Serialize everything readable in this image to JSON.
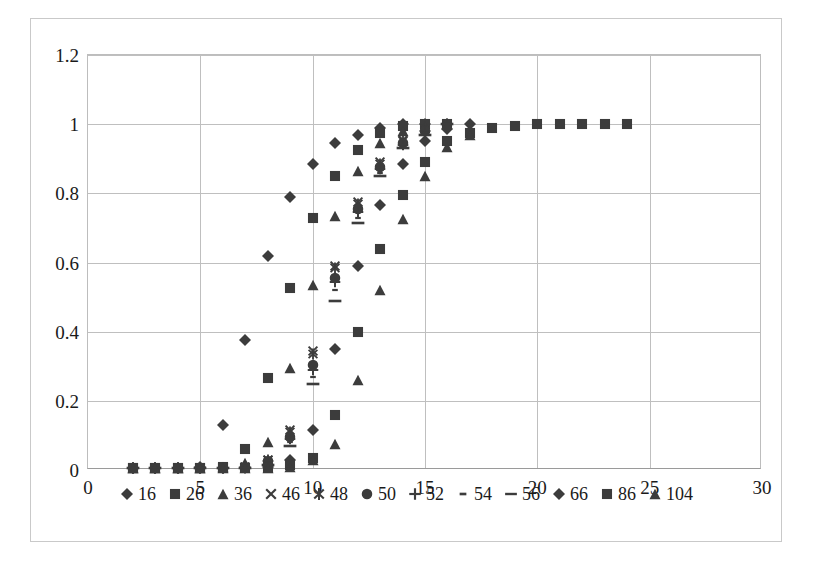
{
  "chart": {
    "type": "scatter",
    "marker_color": "#3c3c3c",
    "gridline_color": "#bfbfbf",
    "border_color": "#c9c9c9"
  },
  "axes": {
    "x": {
      "label": "",
      "min": 0,
      "max": 30,
      "ticks": [
        "0",
        "5",
        "10",
        "15",
        "20",
        "25",
        "30"
      ],
      "tick_values": [
        0,
        5,
        10,
        15,
        20,
        25,
        30
      ]
    },
    "y": {
      "label": "",
      "min": 0,
      "max": 1.2,
      "ticks": [
        "0",
        "0.2",
        "0.4",
        "0.6",
        "0.8",
        "1",
        "1.2"
      ],
      "tick_values": [
        0,
        0.2,
        0.4,
        0.6,
        0.8,
        1,
        1.2
      ]
    }
  },
  "legend": {
    "position": "bottom",
    "items": [
      {
        "label": "16",
        "marker": "diamond"
      },
      {
        "label": "26",
        "marker": "square"
      },
      {
        "label": "36",
        "marker": "triangle"
      },
      {
        "label": "46",
        "marker": "x-cross"
      },
      {
        "label": "48",
        "marker": "star"
      },
      {
        "label": "50",
        "marker": "circle"
      },
      {
        "label": "52",
        "marker": "plus"
      },
      {
        "label": "54",
        "marker": "short-dash"
      },
      {
        "label": "56",
        "marker": "long-dash"
      },
      {
        "label": "66",
        "marker": "diamond"
      },
      {
        "label": "86",
        "marker": "square"
      },
      {
        "label": "104",
        "marker": "triangle"
      }
    ]
  },
  "chart_data": {
    "type": "scatter",
    "title": "",
    "xlabel": "",
    "ylabel": "",
    "xlim": [
      0,
      30
    ],
    "ylim": [
      0,
      1.2
    ],
    "grid": true,
    "legend_position": "bottom",
    "marker_color": "#3c3c3c",
    "series": [
      {
        "name": "16",
        "marker": "diamond",
        "x": [
          2,
          3,
          4,
          5,
          6,
          7,
          8,
          9,
          10,
          11,
          12,
          13,
          14,
          15
        ],
        "y": [
          0.005,
          0.005,
          0.005,
          0.01,
          0.13,
          0.375,
          0.62,
          0.79,
          0.885,
          0.945,
          0.97,
          0.99,
          1.0,
          1.0
        ]
      },
      {
        "name": "26",
        "marker": "square",
        "x": [
          2,
          3,
          4,
          5,
          6,
          7,
          8,
          9,
          10,
          11,
          12,
          13,
          14,
          15,
          16
        ],
        "y": [
          0.005,
          0.005,
          0.005,
          0.005,
          0.01,
          0.06,
          0.265,
          0.525,
          0.73,
          0.85,
          0.925,
          0.975,
          0.995,
          1.0,
          1.0
        ]
      },
      {
        "name": "36",
        "marker": "triangle",
        "x": [
          2,
          3,
          4,
          5,
          6,
          7,
          8,
          9,
          10,
          11,
          12,
          13,
          14,
          15,
          16
        ],
        "y": [
          0.005,
          0.005,
          0.005,
          0.005,
          0.01,
          0.02,
          0.08,
          0.295,
          0.535,
          0.735,
          0.865,
          0.945,
          0.98,
          0.995,
          1.0
        ]
      },
      {
        "name": "46",
        "marker": "x-cross",
        "x": [
          2,
          3,
          4,
          5,
          6,
          7,
          8,
          9,
          10,
          11,
          12,
          13,
          14,
          15,
          16
        ],
        "y": [
          0.005,
          0.005,
          0.005,
          0.005,
          0.005,
          0.01,
          0.03,
          0.115,
          0.345,
          0.59,
          0.775,
          0.89,
          0.955,
          0.985,
          1.0
        ]
      },
      {
        "name": "48",
        "marker": "star",
        "x": [
          2,
          3,
          4,
          5,
          6,
          7,
          8,
          9,
          10,
          11,
          12,
          13,
          14,
          15,
          16
        ],
        "y": [
          0.005,
          0.005,
          0.005,
          0.005,
          0.005,
          0.01,
          0.03,
          0.11,
          0.335,
          0.585,
          0.77,
          0.885,
          0.95,
          0.985,
          1.0
        ]
      },
      {
        "name": "50",
        "marker": "circle",
        "x": [
          2,
          3,
          4,
          5,
          6,
          7,
          8,
          9,
          10,
          11,
          12,
          13,
          14,
          15,
          16
        ],
        "y": [
          0.005,
          0.005,
          0.005,
          0.005,
          0.005,
          0.01,
          0.025,
          0.095,
          0.305,
          0.555,
          0.755,
          0.875,
          0.945,
          0.98,
          1.0
        ]
      },
      {
        "name": "52",
        "marker": "plus",
        "x": [
          2,
          3,
          4,
          5,
          6,
          7,
          8,
          9,
          10,
          11,
          12,
          13,
          14,
          15,
          16
        ],
        "y": [
          0.005,
          0.005,
          0.005,
          0.005,
          0.005,
          0.01,
          0.025,
          0.09,
          0.29,
          0.545,
          0.745,
          0.87,
          0.94,
          0.98,
          1.0
        ]
      },
      {
        "name": "54",
        "marker": "short-dash",
        "x": [
          2,
          3,
          4,
          5,
          6,
          7,
          8,
          9,
          10,
          11,
          12,
          13,
          14,
          15,
          16
        ],
        "y": [
          0.005,
          0.005,
          0.005,
          0.005,
          0.005,
          0.005,
          0.02,
          0.08,
          0.27,
          0.52,
          0.73,
          0.86,
          0.935,
          0.975,
          1.0
        ]
      },
      {
        "name": "56",
        "marker": "long-dash",
        "x": [
          2,
          3,
          4,
          5,
          6,
          7,
          8,
          9,
          10,
          11,
          12,
          13,
          14,
          15,
          16
        ],
        "y": [
          0.005,
          0.005,
          0.005,
          0.005,
          0.005,
          0.005,
          0.015,
          0.07,
          0.25,
          0.49,
          0.715,
          0.85,
          0.93,
          0.97,
          1.0
        ]
      },
      {
        "name": "66",
        "marker": "diamond",
        "x": [
          2,
          3,
          4,
          5,
          6,
          7,
          8,
          9,
          10,
          11,
          12,
          13,
          14,
          15,
          16,
          17
        ],
        "y": [
          0.005,
          0.005,
          0.005,
          0.005,
          0.005,
          0.005,
          0.01,
          0.03,
          0.115,
          0.35,
          0.59,
          0.765,
          0.885,
          0.95,
          0.985,
          1.0
        ]
      },
      {
        "name": "86",
        "marker": "square",
        "x": [
          2,
          3,
          4,
          5,
          6,
          7,
          8,
          9,
          10,
          11,
          12,
          13,
          14,
          15,
          16,
          17,
          18,
          19,
          20,
          21,
          22,
          23,
          24
        ],
        "y": [
          0.005,
          0.005,
          0.005,
          0.005,
          0.005,
          0.005,
          0.005,
          0.015,
          0.035,
          0.16,
          0.4,
          0.64,
          0.795,
          0.89,
          0.95,
          0.975,
          0.99,
          0.995,
          1.0,
          1.0,
          1.0,
          1.0,
          1.0
        ]
      },
      {
        "name": "104",
        "marker": "triangle",
        "x": [
          2,
          3,
          4,
          5,
          6,
          7,
          8,
          9,
          10,
          11,
          12,
          13,
          14,
          15,
          16,
          17
        ],
        "y": [
          0.005,
          0.005,
          0.005,
          0.005,
          0.005,
          0.005,
          0.005,
          0.01,
          0.03,
          0.075,
          0.26,
          0.52,
          0.725,
          0.85,
          0.935,
          0.97
        ]
      }
    ]
  }
}
